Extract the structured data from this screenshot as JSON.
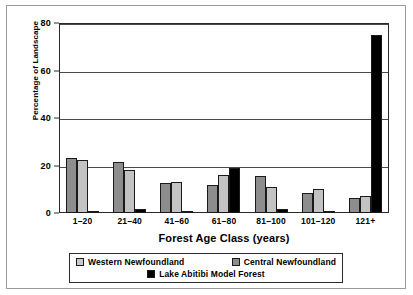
{
  "chart_data": {
    "type": "bar",
    "title": "",
    "xlabel": "Forest Age Class (years)",
    "ylabel": "Percentage of Landscape",
    "categories": [
      "1–20",
      "21–40",
      "41–60",
      "61–80",
      "81–100",
      "101–120",
      "121+"
    ],
    "series": [
      {
        "name": "Western Newfoundland",
        "color": "#8d8d8d",
        "legend_swatch_color": "#c9c9c9",
        "values": [
          23,
          21.5,
          12.5,
          12,
          15.5,
          8.5,
          6.5
        ]
      },
      {
        "name": "Central Newfoundland",
        "color": "#c3c3c3",
        "legend_swatch_color": "#8d8d8d",
        "values": [
          22.5,
          18,
          13,
          16,
          11,
          10,
          7
        ]
      },
      {
        "name": "Lake Abitibi Model Forest",
        "color": "#000000",
        "legend_swatch_color": "#000000",
        "values": [
          1,
          1.5,
          0.8,
          19,
          1.5,
          0.5,
          75
        ]
      }
    ],
    "ylim": [
      0,
      80
    ],
    "yticks": [
      0,
      20,
      40,
      60,
      80
    ],
    "ytick_labels": [
      "0",
      "20",
      "40",
      "60",
      "80"
    ],
    "grid": true,
    "grid_axis": "y",
    "legend_position": "bottom"
  },
  "legend": {
    "entries": [
      {
        "label": "Western Newfoundland"
      },
      {
        "label": "Central Newfoundland"
      },
      {
        "label": "Lake Abitibi Model Forest"
      }
    ]
  }
}
